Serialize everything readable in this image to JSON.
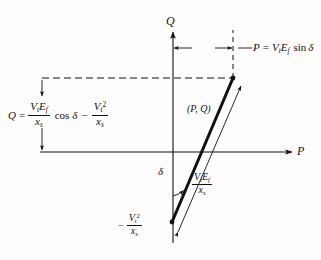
{
  "figure": {
    "background_color": "#fdfdfd",
    "line_color": "#111111"
  },
  "axes": {
    "q_axis_label": "Q",
    "p_axis_label": "P",
    "q_axis_x": 173,
    "p_axis_y": 152,
    "origin": [
      173,
      152
    ]
  },
  "labels": {
    "p_equation": {
      "lhs": "P",
      "equals": "=",
      "v_symbol": "V",
      "v_sub": "t",
      "e_symbol": "E",
      "e_sub": "f",
      "trig": "sin",
      "angle": "δ",
      "plain_text": "P = V t E f  sin δ"
    },
    "q_equation": {
      "lhs": "Q",
      "equals": "=",
      "num_v": "V",
      "num_v_sub": "t",
      "num_e": "E",
      "num_e_sub": "f",
      "den_x": "x",
      "den_x_sub": "s",
      "trig": "cos",
      "angle": "δ",
      "minus": "−",
      "term2_num_v": "V",
      "term2_num_v_sub": "t",
      "term2_num_sup": "2",
      "term2_den_x": "x",
      "term2_den_x_sub": "s",
      "plain_text": "Q = (V t E f / x s) cos δ − V t² / x s"
    },
    "point_label": {
      "text": "(P, Q)"
    },
    "vector_magnitude": {
      "num_v": "V",
      "num_v_sub": "t",
      "num_e": "E",
      "num_e_sub": "f",
      "den_x": "x",
      "den_x_sub": "s",
      "plain_text": "V t E f / x s"
    },
    "origin_offset": {
      "minus": "−",
      "num_v": "V",
      "num_v_sub": "t",
      "num_sup": "2",
      "den_x": "x",
      "den_x_sub": "s",
      "plain_text": "− V t² / x s"
    },
    "angle_label": {
      "text": "δ"
    }
  },
  "geometry": {
    "point_pq": [
      233,
      78
    ],
    "vector_tail": [
      172,
      222
    ],
    "dashed_horizontal_y": 78,
    "dashed_horizontal_x_start": 42,
    "dashed_vertical_x": 233,
    "q_dimension_x": 42,
    "q_dimension_y_top": 78,
    "q_dimension_y_bottom": 152,
    "p_dimension_y": 48,
    "p_dimension_x_left": 173,
    "p_dimension_x_right": 233
  }
}
